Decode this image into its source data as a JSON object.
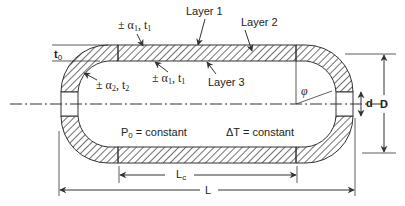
{
  "diagram": {
    "colors": {
      "stroke": "#333333",
      "hatch": "#333333",
      "background": "#ffffff"
    },
    "labels": {
      "layer1": "Layer 1",
      "layer2": "Layer 2",
      "layer3": "Layer 3",
      "t0": "t",
      "t0_sub": "0",
      "alpha1_top": "± α",
      "alpha1_top_sub": "1",
      "alpha1_top_tail": ", t",
      "alpha1_top_tail_sub": "1",
      "alpha1_inner": "± α",
      "alpha1_inner_sub": "1",
      "alpha1_inner_tail": ", t",
      "alpha1_inner_tail_sub": "1",
      "alpha2": "± α",
      "alpha2_sub": "2",
      "alpha2_tail": ", t",
      "alpha2_tail_sub": "2",
      "phi": "φ",
      "d": "d",
      "D": "D",
      "P0": "P",
      "P0_sub": "0",
      "P0_tail": " = constant",
      "dT": "ΔT = constant",
      "Lc": "L",
      "Lc_sub": "c",
      "L": "L"
    }
  }
}
